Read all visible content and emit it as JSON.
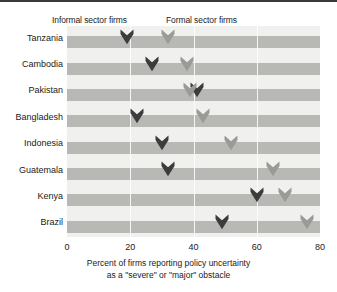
{
  "legend": {
    "informal_label": "Informal sector firms",
    "formal_label": "Formal sector firms",
    "informal_color": "#3c3c3c",
    "formal_color": "#9a9a96"
  },
  "axis": {
    "ticks": [
      "0",
      "20",
      "40",
      "60",
      "80"
    ],
    "title_line1": "Percent of firms reporting policy uncertainty",
    "title_line2": "as a \"severe\" or \"major\" obstacle"
  },
  "categories": [
    "Tanzania",
    "Cambodia",
    "Pakistan",
    "Bangladesh",
    "Indonesia",
    "Guatemala",
    "Kenya",
    "Brazil"
  ],
  "chart_data": {
    "type": "scatter",
    "title": "",
    "xlabel": "Percent of firms reporting policy uncertainty as a \"severe\" or \"major\" obstacle",
    "ylabel": "",
    "xlim": [
      0,
      80
    ],
    "xticks": [
      0,
      20,
      40,
      60,
      80
    ],
    "grid": true,
    "legend_position": "top",
    "categories": [
      "Tanzania",
      "Cambodia",
      "Pakistan",
      "Bangladesh",
      "Indonesia",
      "Guatemala",
      "Kenya",
      "Brazil"
    ],
    "series": [
      {
        "name": "Informal sector firms",
        "color": "#3c3c3c",
        "values": [
          19,
          27,
          41,
          22,
          30,
          32,
          60,
          49
        ]
      },
      {
        "name": "Formal sector firms",
        "color": "#9a9a96",
        "values": [
          32,
          38,
          39,
          43,
          52,
          65,
          69,
          76
        ]
      }
    ]
  }
}
